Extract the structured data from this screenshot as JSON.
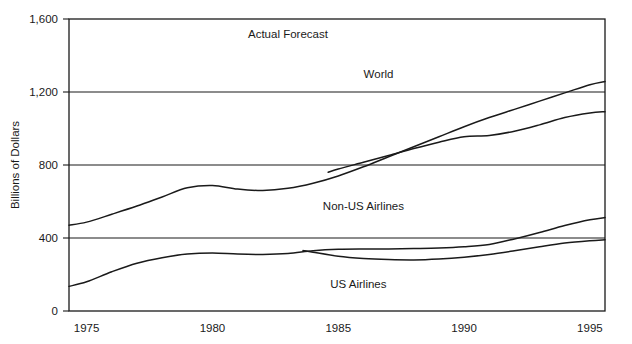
{
  "chart_data": {
    "type": "line",
    "title": "",
    "xlabel": "",
    "ylabel": "Billions of Dollars",
    "xlim": [
      1974.3,
      1995.6
    ],
    "ylim": [
      0,
      1600
    ],
    "xticks": [
      1975,
      1980,
      1985,
      1990,
      1995
    ],
    "xtick_labels": [
      "1975",
      "1980",
      "1985",
      "1990",
      "1995"
    ],
    "yticks": [
      0,
      400,
      800,
      1200,
      1600
    ],
    "ytick_labels": [
      "0",
      "400",
      "800",
      "1,200",
      "1,600"
    ],
    "grid": "horizontal",
    "legend": "inline-labels",
    "annotations": [
      {
        "text": "Actual Forecast",
        "x": 1983.0,
        "y": 1520
      },
      {
        "text": "World",
        "x": 1986.6,
        "y": 1300
      },
      {
        "text": "Non-US Airlines",
        "x": 1986.0,
        "y": 575
      },
      {
        "text": "US Airlines",
        "x": 1985.8,
        "y": 150
      }
    ],
    "series": [
      {
        "name": "World (upper projection)",
        "x": [
          1974.3,
          1975,
          1976,
          1977,
          1978,
          1979,
          1980,
          1981,
          1982,
          1983,
          1984,
          1985,
          1986,
          1987,
          1988,
          1989,
          1990,
          1991,
          1992,
          1993,
          1994,
          1995,
          1995.6
        ],
        "values": [
          470,
          487,
          530,
          575,
          625,
          675,
          688,
          668,
          660,
          672,
          700,
          740,
          790,
          845,
          900,
          955,
          1010,
          1060,
          1105,
          1150,
          1195,
          1240,
          1258
        ]
      },
      {
        "name": "World (lower projection)",
        "x": [
          1984.6,
          1985,
          1986,
          1987,
          1988,
          1989,
          1990,
          1991,
          1992,
          1993,
          1994,
          1995,
          1995.6
        ],
        "values": [
          760,
          778,
          815,
          852,
          890,
          925,
          955,
          962,
          985,
          1020,
          1060,
          1085,
          1092
        ]
      },
      {
        "name": "US Airlines (upper projection)",
        "x": [
          1974.3,
          1975,
          1976,
          1977,
          1978,
          1979,
          1980,
          1981,
          1982,
          1983,
          1984,
          1985,
          1986,
          1987,
          1988,
          1989,
          1990,
          1991,
          1992,
          1993,
          1994,
          1995,
          1995.6
        ],
        "values": [
          135,
          160,
          215,
          262,
          292,
          312,
          318,
          312,
          310,
          315,
          330,
          338,
          340,
          340,
          342,
          345,
          352,
          365,
          395,
          430,
          468,
          500,
          512
        ]
      },
      {
        "name": "US Airlines (lower projection)",
        "x": [
          1983.6,
          1984,
          1985,
          1986,
          1987,
          1988,
          1989,
          1990,
          1991,
          1992,
          1993,
          1994,
          1995,
          1995.6
        ],
        "values": [
          332,
          322,
          300,
          288,
          282,
          280,
          285,
          295,
          310,
          330,
          352,
          372,
          385,
          390
        ]
      }
    ]
  },
  "axis": {
    "y_title": "Billions of Dollars"
  }
}
